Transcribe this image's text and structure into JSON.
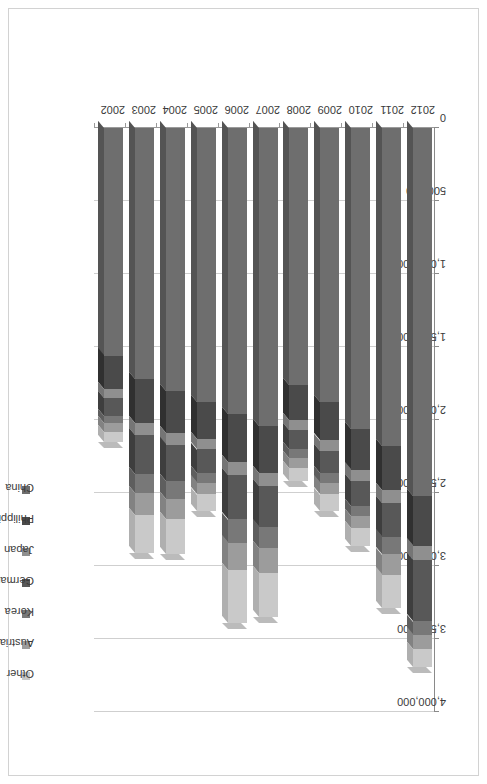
{
  "chart_data": {
    "type": "bar",
    "subtype": "stacked-horizontal-3d",
    "title": "",
    "xlabel": "",
    "ylabel": "",
    "orientation": "rotated-90",
    "grid": true,
    "legend_position": "top",
    "axis_max": 4000000,
    "axis_min": 0,
    "xlim": [
      0,
      4000000
    ],
    "tick_labels": [
      "4,000,000",
      "3,500,000",
      "3,000,000",
      "2,500,000",
      "2,000,000",
      "1,500,000",
      "1,000,000",
      "500,000",
      "0"
    ],
    "tick_values": [
      4000000,
      3500000,
      3000000,
      2500000,
      2000000,
      1500000,
      1000000,
      500000,
      0
    ],
    "categories": [
      "2002",
      "2003",
      "2004",
      "2005",
      "2006",
      "2007",
      "2008",
      "2009",
      "2010",
      "2011",
      "2012"
    ],
    "series": [
      {
        "name": "China",
        "color": "#6e6e6e",
        "values": [
          1560000,
          1720000,
          1800000,
          1880000,
          1960000,
          2040000,
          1760000,
          1880000,
          2060000,
          2180000,
          2520000
        ]
      },
      {
        "name": "Philippines",
        "color": "#4a4a4a",
        "values": [
          230000,
          300000,
          290000,
          250000,
          330000,
          320000,
          240000,
          260000,
          280000,
          300000,
          340000
        ]
      },
      {
        "name": "Japan",
        "color": "#8f8f8f",
        "values": [
          60000,
          80000,
          80000,
          70000,
          90000,
          90000,
          70000,
          70000,
          80000,
          90000,
          100000
        ]
      },
      {
        "name": "Germany",
        "color": "#585858",
        "values": [
          120000,
          270000,
          250000,
          160000,
          300000,
          280000,
          130000,
          150000,
          170000,
          230000,
          420000
        ]
      },
      {
        "name": "Korea",
        "color": "#787878",
        "values": [
          50000,
          130000,
          120000,
          70000,
          160000,
          150000,
          60000,
          70000,
          70000,
          120000,
          90000
        ]
      },
      {
        "name": "Austria",
        "color": "#9c9c9c",
        "values": [
          60000,
          150000,
          140000,
          80000,
          190000,
          170000,
          70000,
          80000,
          80000,
          140000,
          100000
        ]
      },
      {
        "name": "Other",
        "color": "#c9c9c9",
        "values": [
          70000,
          260000,
          240000,
          110000,
          360000,
          300000,
          90000,
          110000,
          120000,
          230000,
          120000
        ]
      }
    ],
    "totals": [
      2150000,
      2910000,
      2920000,
      2620000,
      3390000,
      3350000,
      2420000,
      2620000,
      2860000,
      3290000,
      3690000
    ]
  },
  "legend": {
    "items": [
      {
        "label": "Other",
        "color": "#c9c9c9"
      },
      {
        "label": "Austria",
        "color": "#9c9c9c"
      },
      {
        "label": "Korea",
        "color": "#787878"
      },
      {
        "label": "Germany",
        "color": "#585858"
      },
      {
        "label": "Japan",
        "color": "#8f8f8f"
      },
      {
        "label": "Philippines",
        "color": "#4a4a4a"
      },
      {
        "label": "China",
        "color": "#6e6e6e"
      }
    ]
  }
}
